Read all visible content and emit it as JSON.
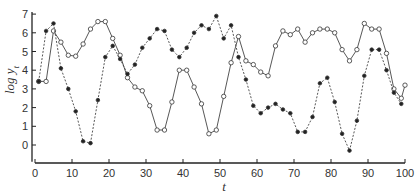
{
  "chart_data": {
    "type": "line",
    "title": "",
    "xlabel": "t",
    "ylabel": "log y_t",
    "xlim": [
      0,
      100
    ],
    "ylim": [
      -1,
      7
    ],
    "x_ticks": [
      0,
      10,
      20,
      30,
      40,
      50,
      60,
      70,
      80,
      90,
      100
    ],
    "y_ticks": [
      0,
      1,
      2,
      3,
      4,
      5,
      6,
      7
    ],
    "grid": false,
    "legend": "none",
    "series": [
      {
        "name": "solid-open-circles",
        "style": "solid",
        "marker": "open-circle",
        "x": [
          1,
          3,
          5,
          7,
          9,
          11,
          13,
          15,
          17,
          19,
          21,
          23,
          25,
          27,
          29,
          31,
          33,
          35,
          37,
          39,
          41,
          43,
          45,
          47,
          49,
          51,
          53,
          55,
          57,
          59,
          61,
          63,
          65,
          67,
          69,
          71,
          73,
          75,
          77,
          79,
          81,
          83,
          85,
          87,
          89,
          91,
          93,
          95,
          97,
          99,
          100
        ],
        "values": [
          3.4,
          3.4,
          6.1,
          5.5,
          4.8,
          4.75,
          5.4,
          6.2,
          6.6,
          6.6,
          5.7,
          4.8,
          3.6,
          3.1,
          2.9,
          2.1,
          0.8,
          0.8,
          2.3,
          4.0,
          4.0,
          3.1,
          2.2,
          0.6,
          0.8,
          2.6,
          4.4,
          5.8,
          4.5,
          4.3,
          3.9,
          3.7,
          5.3,
          6.1,
          5.9,
          6.2,
          5.5,
          6.0,
          6.2,
          6.2,
          6.0,
          5.1,
          4.5,
          5.1,
          6.5,
          6.2,
          6.2,
          4.9,
          3.0,
          2.5,
          3.2
        ]
      },
      {
        "name": "dashed-filled-circles",
        "style": "dashed",
        "marker": "filled-circle",
        "x": [
          1,
          3,
          5,
          7,
          9,
          11,
          13,
          15,
          17,
          19,
          21,
          23,
          25,
          27,
          29,
          31,
          33,
          35,
          37,
          39,
          41,
          43,
          45,
          47,
          49,
          51,
          53,
          55,
          57,
          59,
          61,
          63,
          65,
          67,
          69,
          71,
          73,
          75,
          77,
          79,
          81,
          83,
          85,
          87,
          89,
          91,
          93,
          95,
          97,
          99
        ],
        "values": [
          3.4,
          6.1,
          6.5,
          4.1,
          3.0,
          1.8,
          0.2,
          0.1,
          2.4,
          4.7,
          5.3,
          4.6,
          3.8,
          4.3,
          5.2,
          5.7,
          6.2,
          6.1,
          5.1,
          4.7,
          5.2,
          6.0,
          6.4,
          6.2,
          6.9,
          5.7,
          6.4,
          4.7,
          3.5,
          2.1,
          1.7,
          2.0,
          2.2,
          1.9,
          1.7,
          0.7,
          0.7,
          1.5,
          3.3,
          3.6,
          2.3,
          0.6,
          -0.3,
          1.3,
          3.7,
          5.1,
          5.1,
          4.0,
          2.8,
          2.2
        ]
      }
    ]
  },
  "labels": {
    "xlabel": "t",
    "ylabel_main": "log y",
    "ylabel_sub": "t"
  },
  "colors": {
    "line": "#444444",
    "axis": "#222222",
    "background": "#ffffff"
  }
}
